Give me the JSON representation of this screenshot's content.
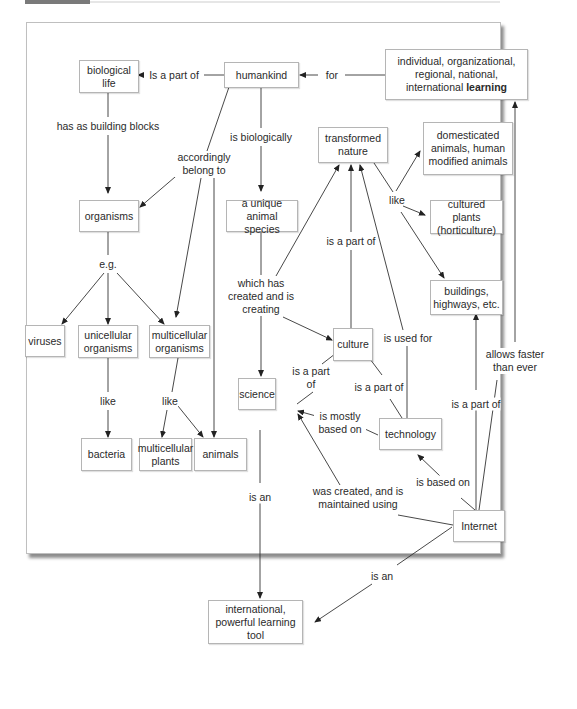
{
  "figure": {
    "type": "concept map",
    "nodes": {
      "biological_life": "biological life",
      "humankind": "humankind",
      "learning_prefix": "individual, organizational, regional, national, international ",
      "learning_bold": "learning",
      "organisms": "organisms",
      "unique_species": "a unique animal species",
      "transformed_nature": "transformed nature",
      "domesticated_animals": "domesticated animals, human modified animals",
      "cultured_plants": "cultured plants (horticulture)",
      "buildings": "buildings, highways, etc.",
      "viruses": "viruses",
      "unicellular": "unicellular organisms",
      "multicellular": "multicellular organisms",
      "culture": "culture",
      "science": "science",
      "technology": "technology",
      "bacteria": "bacteria",
      "multicellular_plants": "multicellular plants",
      "animals": "animals",
      "internet": "Internet",
      "learning_tool": "international, powerful learning tool"
    },
    "links": {
      "is_a_part_of_top": "Is a part of",
      "for": "for",
      "has_as_building_blocks": "has as building blocks",
      "is_biologically": "is biologically",
      "accordingly_belong_to": "accordingly belong to",
      "eg": "e.g.",
      "like_nature": "like",
      "is_a_part_of_culture_nature": "is a part of",
      "which_has_created": "which has created and is creating",
      "is_used_for": "is used for",
      "like_uni": "like",
      "like_multi": "like",
      "is_a_part_of_science_culture": "is a part of",
      "is_a_part_of_tech_culture": "is a part of",
      "is_mostly_based_on": "is mostly based on",
      "is_a_part_of_internet_buildings": "is a part of",
      "allows_faster": "allows faster than ever",
      "is_based_on": "is based on",
      "was_created": "was created, and is maintained using",
      "is_an_science": "is an",
      "is_an_internet": "is an"
    }
  }
}
